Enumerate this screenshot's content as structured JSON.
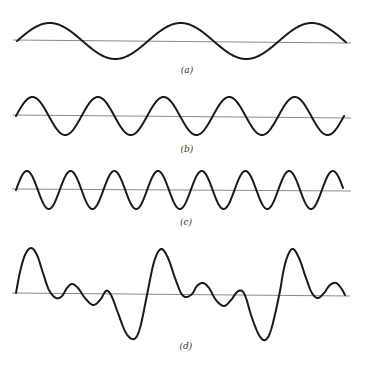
{
  "figure": {
    "panels": [
      {
        "id": "a",
        "label": "(a)",
        "label_pos": [
          187,
          65
        ],
        "axis": {
          "x1": 13,
          "y1": 40,
          "x2": 351,
          "y2": 43
        },
        "wave": {
          "type": "sine",
          "x_start": 17,
          "x_end": 346,
          "baseline": 41,
          "amplitude": 18,
          "period": 131,
          "phase_deg": 0
        }
      },
      {
        "id": "b",
        "label": "(b)",
        "label_pos": [
          187,
          144
        ],
        "axis": {
          "x1": 13,
          "y1": 115,
          "x2": 351,
          "y2": 118
        },
        "wave": {
          "type": "sine",
          "x_start": 16,
          "x_end": 344,
          "baseline": 116,
          "amplitude": 19,
          "period": 65.6,
          "phase_deg": 0
        }
      },
      {
        "id": "c",
        "label": "(c)",
        "label_pos": [
          186,
          217
        ],
        "axis": {
          "x1": 12,
          "y1": 189,
          "x2": 351,
          "y2": 191
        },
        "wave": {
          "type": "sine",
          "x_start": 16,
          "x_end": 343,
          "baseline": 190,
          "amplitude": 19,
          "period": 43.7,
          "phase_deg": 0
        }
      },
      {
        "id": "d",
        "label": "(d)",
        "label_pos": [
          186,
          341
        ],
        "axis": {
          "x1": 12,
          "y1": 293,
          "x2": 350,
          "y2": 296
        },
        "wave": {
          "type": "points",
          "points": [
            [
              16,
              293
            ],
            [
              20,
              272
            ],
            [
              25,
              255
            ],
            [
              31,
              248
            ],
            [
              37,
              255
            ],
            [
              43,
              273
            ],
            [
              49,
              290
            ],
            [
              56,
              298
            ],
            [
              62,
              296
            ],
            [
              67,
              288
            ],
            [
              72,
              284
            ],
            [
              78,
              288
            ],
            [
              85,
              298
            ],
            [
              93,
              305
            ],
            [
              100,
              300
            ],
            [
              105,
              292
            ],
            [
              108,
              291
            ],
            [
              112,
              297
            ],
            [
              118,
              313
            ],
            [
              126,
              333
            ],
            [
              134,
              339
            ],
            [
              140,
              328
            ],
            [
              147,
              295
            ],
            [
              154,
              262
            ],
            [
              161,
              249
            ],
            [
              168,
              258
            ],
            [
              175,
              278
            ],
            [
              181,
              293
            ],
            [
              186,
              297
            ],
            [
              192,
              294
            ],
            [
              197,
              286
            ],
            [
              203,
              283
            ],
            [
              209,
              288
            ],
            [
              216,
              300
            ],
            [
              224,
              306
            ],
            [
              231,
              300
            ],
            [
              237,
              292
            ],
            [
              242,
              291
            ],
            [
              246,
              298
            ],
            [
              252,
              318
            ],
            [
              259,
              335
            ],
            [
              265,
              340
            ],
            [
              271,
              330
            ],
            [
              279,
              296
            ],
            [
              285,
              264
            ],
            [
              292,
              249
            ],
            [
              299,
              258
            ],
            [
              306,
              278
            ],
            [
              312,
              293
            ],
            [
              318,
              298
            ],
            [
              324,
              293
            ],
            [
              330,
              285
            ],
            [
              336,
              283
            ],
            [
              341,
              288
            ],
            [
              345,
              295
            ]
          ]
        }
      }
    ]
  }
}
